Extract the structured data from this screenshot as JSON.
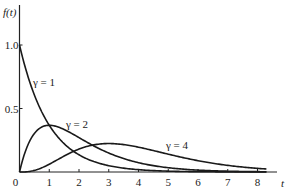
{
  "chart_data": {
    "type": "line",
    "title": "",
    "xlabel": "t",
    "ylabel": "f(t)",
    "xlim": [
      0,
      8.8
    ],
    "ylim": [
      0,
      1.3
    ],
    "grid": false,
    "legend": "inline labels",
    "x_ticks": [
      "0",
      "1",
      "2",
      "3",
      "4",
      "5",
      "6",
      "7",
      "8"
    ],
    "y_ticks": [
      "0.5",
      "1.0"
    ],
    "y_tick_values": [
      0.5,
      1.0
    ],
    "series": [
      {
        "name": "γ = 1",
        "formula": "exp(-t)",
        "label_pos": [
          0.5,
          0.72
        ],
        "x": [
          0,
          0.5,
          1,
          1.5,
          2,
          3,
          4,
          5,
          6,
          7,
          8
        ],
        "values": [
          1.0,
          0.61,
          0.37,
          0.22,
          0.14,
          0.05,
          0.02,
          0.007,
          0.002,
          0.001,
          0.0
        ]
      },
      {
        "name": "γ = 2",
        "formula": "t*exp(-t)",
        "label_pos": [
          1.6,
          0.38
        ],
        "x": [
          0,
          0.5,
          1,
          1.5,
          2,
          3,
          4,
          5,
          6,
          7,
          8
        ],
        "values": [
          0.0,
          0.3,
          0.37,
          0.33,
          0.27,
          0.15,
          0.07,
          0.03,
          0.015,
          0.006,
          0.003
        ]
      },
      {
        "name": "γ = 4",
        "formula": "t^3*exp(-t)/6",
        "label_pos": [
          4.9,
          0.21
        ],
        "x": [
          0,
          0.5,
          1,
          1.5,
          2,
          3,
          4,
          5,
          6,
          7,
          8
        ],
        "values": [
          0.0,
          0.013,
          0.06,
          0.13,
          0.18,
          0.22,
          0.2,
          0.14,
          0.09,
          0.05,
          0.03
        ]
      }
    ]
  },
  "labels": {
    "y_axis": "f(t)",
    "x_axis": "t",
    "origin": "0",
    "curve1": "γ = 1",
    "curve2": "γ = 2",
    "curve4": "γ = 4"
  }
}
